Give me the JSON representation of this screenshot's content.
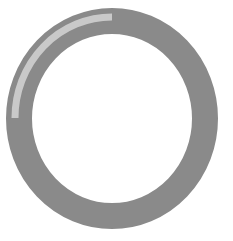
{
  "spinner": {
    "label": "Loading",
    "ring_color": "#8a8a8a",
    "highlight_color": "#c9c9c9",
    "background_color": "#ffffff",
    "progress_arc_degrees": 90
  }
}
